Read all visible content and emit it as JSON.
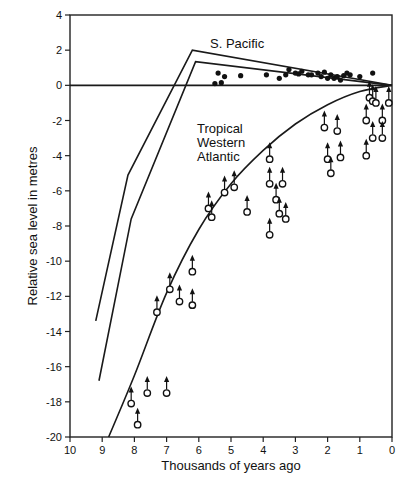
{
  "chart_data": {
    "type": "scatter",
    "title": "",
    "xlabel": "Thousands of years ago",
    "ylabel": "Relative sea level in metres",
    "xlim": [
      10,
      0
    ],
    "ylim": [
      -20,
      4
    ],
    "x_ticks": [
      "10",
      "9",
      "8",
      "7",
      "6",
      "5",
      "4",
      "3",
      "2",
      "1",
      "0"
    ],
    "y_ticks": [
      "4",
      "2",
      "0",
      "-2",
      "-4",
      "-6",
      "-8",
      "-10",
      "-12",
      "-14",
      "-16",
      "-18",
      "-20"
    ],
    "grid": false,
    "legend": null,
    "annotations": [
      {
        "text": "S. Pacific",
        "x": 5.2,
        "y": 2.2
      },
      {
        "text": "Tropical",
        "x": 5.9,
        "y": -3.2
      },
      {
        "text": "Western",
        "x": 5.9,
        "y": -4.0
      },
      {
        "text": "Atlantic",
        "x": 5.9,
        "y": -4.8
      }
    ],
    "series": [
      {
        "name": "S. Pacific envelope upper",
        "kind": "line",
        "points": [
          [
            9.2,
            -13.4
          ],
          [
            8.2,
            -5.1
          ],
          [
            6.2,
            2.0
          ],
          [
            0,
            0
          ]
        ]
      },
      {
        "name": "S. Pacific envelope lower",
        "kind": "line",
        "points": [
          [
            9.1,
            -16.8
          ],
          [
            8.1,
            -7.6
          ],
          [
            6.1,
            1.35
          ],
          [
            0,
            0
          ]
        ]
      },
      {
        "name": "Zero line",
        "kind": "line",
        "points": [
          [
            10,
            0
          ],
          [
            0,
            0
          ]
        ]
      },
      {
        "name": "Tropical Western Atlantic curve",
        "kind": "line",
        "points": [
          [
            8.8,
            -20
          ],
          [
            8,
            -16.5
          ],
          [
            7,
            -11.8
          ],
          [
            6,
            -8.2
          ],
          [
            5,
            -5.6
          ],
          [
            4,
            -3.7
          ],
          [
            3,
            -2.2
          ],
          [
            2,
            -1.1
          ],
          [
            1,
            -0.35
          ],
          [
            0,
            0
          ]
        ]
      },
      {
        "name": "S. Pacific data",
        "kind": "scatter-filled",
        "points": [
          [
            5.5,
            0.1
          ],
          [
            5.3,
            0.15
          ],
          [
            5.2,
            0.5
          ],
          [
            5.4,
            0.7
          ],
          [
            4.7,
            0.55
          ],
          [
            3.9,
            0.6
          ],
          [
            3.5,
            0.4
          ],
          [
            3.3,
            0.6
          ],
          [
            3.2,
            0.9
          ],
          [
            3.0,
            0.7
          ],
          [
            2.9,
            0.65
          ],
          [
            2.8,
            0.8
          ],
          [
            2.6,
            0.6
          ],
          [
            2.5,
            0.6
          ],
          [
            2.3,
            0.7
          ],
          [
            2.2,
            0.5
          ],
          [
            2.1,
            0.75
          ],
          [
            2.0,
            0.4
          ],
          [
            1.9,
            0.6
          ],
          [
            1.8,
            0.4
          ],
          [
            1.7,
            0.5
          ],
          [
            1.6,
            0.3
          ],
          [
            1.5,
            0.55
          ],
          [
            1.4,
            0.7
          ],
          [
            1.3,
            0.6
          ],
          [
            1.0,
            0.5
          ],
          [
            0.6,
            0.7
          ]
        ]
      },
      {
        "name": "Tropical Western Atlantic data (minimum, arrows up)",
        "kind": "scatter-open-arrow",
        "points": [
          [
            8.1,
            -18.1
          ],
          [
            7.9,
            -19.3
          ],
          [
            7.6,
            -17.5
          ],
          [
            7.0,
            -17.5
          ],
          [
            7.3,
            -12.9
          ],
          [
            6.9,
            -11.6
          ],
          [
            6.6,
            -12.3
          ],
          [
            6.2,
            -12.5
          ],
          [
            6.2,
            -10.6
          ],
          [
            5.7,
            -7.0
          ],
          [
            5.6,
            -7.5
          ],
          [
            5.2,
            -6.1
          ],
          [
            4.9,
            -5.8
          ],
          [
            4.5,
            -7.2
          ],
          [
            3.8,
            -8.5
          ],
          [
            3.8,
            -5.6
          ],
          [
            3.6,
            -6.5
          ],
          [
            3.5,
            -7.3
          ],
          [
            3.4,
            -5.6
          ],
          [
            3.3,
            -7.6
          ],
          [
            3.8,
            -4.2
          ],
          [
            2.1,
            -2.4
          ],
          [
            2.0,
            -4.2
          ],
          [
            1.9,
            -5.0
          ],
          [
            1.7,
            -2.6
          ],
          [
            1.6,
            -4.1
          ],
          [
            0.8,
            -2.0
          ],
          [
            0.7,
            -0.7
          ],
          [
            0.6,
            -0.9
          ],
          [
            0.5,
            -1.0
          ],
          [
            0.8,
            -4.0
          ],
          [
            0.6,
            -3.0
          ],
          [
            0.3,
            -2.0
          ],
          [
            0.3,
            -3.0
          ],
          [
            0.1,
            -1.0
          ]
        ]
      }
    ]
  },
  "axes": {
    "xlabel": "Thousands of years ago",
    "ylabel": "Relative sea level in metres"
  },
  "labels": {
    "s_pacific": "S. Pacific",
    "twa_1": "Tropical",
    "twa_2": "Western",
    "twa_3": "Atlantic"
  }
}
